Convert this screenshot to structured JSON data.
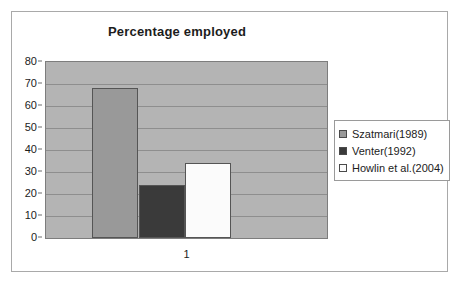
{
  "chart_data": {
    "type": "bar",
    "title": "Percentage employed",
    "xlabel": "",
    "ylabel": "",
    "categories": [
      "1"
    ],
    "ylim": [
      0,
      80
    ],
    "ytick_step": 10,
    "yticks": [
      "80",
      "70",
      "60",
      "50",
      "40",
      "30",
      "20",
      "10",
      "0"
    ],
    "grid": true,
    "legend_position": "right",
    "series": [
      {
        "name": "Szatmari(1989)",
        "values": [
          68
        ],
        "color": "#999999"
      },
      {
        "name": "Venter(1992)",
        "values": [
          24
        ],
        "color": "#3a3a3a"
      },
      {
        "name": "Howlin et al.(2004)",
        "values": [
          34
        ],
        "color": "#fbfbfb"
      }
    ],
    "plot_background": "#b4b4b4",
    "figure_background": "#ffffff"
  }
}
